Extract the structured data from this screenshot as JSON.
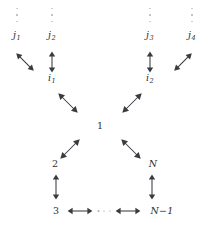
{
  "diagram": {
    "stroke_color": "#3a3a41",
    "text_color": "#2e2e33",
    "dot_color": "#7e7e86",
    "background": "#ffffff",
    "ellipsis_vertical_glyph": "⋮",
    "ellipsis_horizontal_glyph": "⋯",
    "rows": {
      "top_ellipsis_row": "vertical ellipsis above each j node",
      "j_row": "j1 j2 j3 j4",
      "i_row": "i1 i2",
      "root_row": "1",
      "second_row": "2 N",
      "bottom_row": "3 <-> ... <-> N-1"
    },
    "nodes": {
      "j1": {
        "base": "j",
        "sub": "1"
      },
      "j2": {
        "base": "j",
        "sub": "2"
      },
      "j3": {
        "base": "j",
        "sub": "3"
      },
      "j4": {
        "base": "j",
        "sub": "4"
      },
      "i1": {
        "base": "i",
        "sub": "1"
      },
      "i2": {
        "base": "i",
        "sub": "2"
      },
      "root": "1",
      "two": "2",
      "n": "N",
      "three": "3",
      "n_minus_1": "N−1"
    },
    "edges": {
      "j1_i1": {
        "label": "↖↘",
        "kind": "diagonal-nwse"
      },
      "j2_i1": {
        "label": "↕",
        "kind": "vertical"
      },
      "j3_i2": {
        "label": "↕",
        "kind": "vertical"
      },
      "j4_i2": {
        "label": "↗↙",
        "kind": "diagonal-nesw"
      },
      "i1_root": {
        "label": "↖↘",
        "kind": "diagonal-nwse"
      },
      "i2_root": {
        "label": "↗↙",
        "kind": "diagonal-nesw"
      },
      "root_two": {
        "label": "↗↙",
        "kind": "diagonal-nesw"
      },
      "root_n": {
        "label": "↖↘",
        "kind": "diagonal-nwse"
      },
      "two_three": {
        "label": "↕",
        "kind": "vertical"
      },
      "n_nminus1": {
        "label": "↕",
        "kind": "vertical"
      },
      "three_dots": {
        "label": "⟷",
        "kind": "horizontal"
      },
      "dots_nminus1": {
        "label": "⟷",
        "kind": "horizontal"
      }
    }
  }
}
